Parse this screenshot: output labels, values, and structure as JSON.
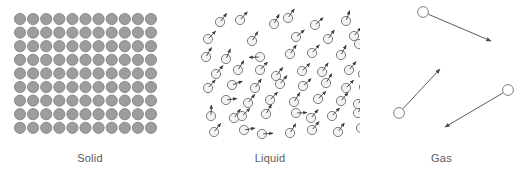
{
  "figure": {
    "width": 523,
    "height": 180,
    "background_color": "#ffffff"
  },
  "panels": [
    {
      "id": "solid",
      "label": "Solid",
      "description": "Regular close-packed lattice of filled gray particles, no motion arrows",
      "particle_style": "filled-circle",
      "particle_fill_color": "#9d9d9d",
      "particle_stroke_color": "#7e7e7e",
      "particle_radius": 5.6,
      "rows": 9,
      "cols": 11,
      "col_spacing": 13.1,
      "row_spacing": 13.6,
      "origin_x": 20,
      "origin_y": 19,
      "has_arrows": false
    },
    {
      "id": "liquid",
      "label": "Liquid",
      "description": "Densely packed but disordered open circles, each with a short motion arrow",
      "particle_style": "open-circle-with-short-arrow",
      "particle_fill_color": "#f4f4f4",
      "particle_stroke_color": "#6e6e6e",
      "particle_radius": 4.6,
      "arrow_color": "#3a3a3a",
      "arrow_length": 11,
      "has_arrows": true,
      "count": 56
    },
    {
      "id": "gas",
      "label": "Gas",
      "description": "Three widely separated open circles, each with a long motion arrow",
      "particle_style": "open-circle-with-long-arrow",
      "particle_fill_color": "#ffffff",
      "particle_stroke_color": "#707070",
      "particle_radius": 5.4,
      "arrow_color": "#4a4a4a",
      "has_arrows": true,
      "count": 3
    }
  ],
  "liquid_particles": [
    {
      "x": 22,
      "y": 14,
      "angle": -52
    },
    {
      "x": 42,
      "y": 12,
      "angle": -48
    },
    {
      "x": 76,
      "y": 16,
      "angle": -62
    },
    {
      "x": 90,
      "y": 10,
      "angle": -55
    },
    {
      "x": 117,
      "y": 17,
      "angle": -42
    },
    {
      "x": 148,
      "y": 13,
      "angle": -70
    },
    {
      "x": 10,
      "y": 31,
      "angle": -46
    },
    {
      "x": 54,
      "y": 33,
      "angle": -58
    },
    {
      "x": 98,
      "y": 29,
      "angle": -40
    },
    {
      "x": 130,
      "y": 31,
      "angle": -55
    },
    {
      "x": 156,
      "y": 28,
      "angle": -50
    },
    {
      "x": 161,
      "y": 36,
      "angle": -44
    },
    {
      "x": 8,
      "y": 49,
      "angle": -60
    },
    {
      "x": 28,
      "y": 51,
      "angle": -66
    },
    {
      "x": 62,
      "y": 49,
      "angle": 178
    },
    {
      "x": 92,
      "y": 46,
      "angle": -55
    },
    {
      "x": 114,
      "y": 45,
      "angle": -48
    },
    {
      "x": 143,
      "y": 47,
      "angle": -62
    },
    {
      "x": 18,
      "y": 66,
      "angle": -50
    },
    {
      "x": 40,
      "y": 62,
      "angle": -58
    },
    {
      "x": 62,
      "y": 62,
      "angle": -47
    },
    {
      "x": 78,
      "y": 68,
      "angle": -52
    },
    {
      "x": 104,
      "y": 63,
      "angle": -44
    },
    {
      "x": 124,
      "y": 64,
      "angle": -56
    },
    {
      "x": 151,
      "y": 62,
      "angle": -50
    },
    {
      "x": 165,
      "y": 66,
      "angle": -61
    },
    {
      "x": 10,
      "y": 80,
      "angle": -48
    },
    {
      "x": 34,
      "y": 77,
      "angle": -20
    },
    {
      "x": 57,
      "y": 80,
      "angle": -55
    },
    {
      "x": 82,
      "y": 76,
      "angle": -50
    },
    {
      "x": 105,
      "y": 78,
      "angle": -42
    },
    {
      "x": 128,
      "y": 75,
      "angle": -58
    },
    {
      "x": 148,
      "y": 80,
      "angle": -46
    },
    {
      "x": 166,
      "y": 79,
      "angle": -53
    },
    {
      "x": 28,
      "y": 92,
      "angle": -8
    },
    {
      "x": 50,
      "y": 95,
      "angle": -52
    },
    {
      "x": 72,
      "y": 92,
      "angle": -46
    },
    {
      "x": 96,
      "y": 94,
      "angle": -58
    },
    {
      "x": 120,
      "y": 91,
      "angle": -44
    },
    {
      "x": 143,
      "y": 93,
      "angle": -50
    },
    {
      "x": 160,
      "y": 96,
      "angle": -56
    },
    {
      "x": 13,
      "y": 108,
      "angle": -88
    },
    {
      "x": 36,
      "y": 110,
      "angle": -54
    },
    {
      "x": 68,
      "y": 106,
      "angle": -60
    },
    {
      "x": 98,
      "y": 105,
      "angle": -2
    },
    {
      "x": 113,
      "y": 110,
      "angle": -50
    },
    {
      "x": 134,
      "y": 108,
      "angle": -47
    },
    {
      "x": 160,
      "y": 105,
      "angle": -64
    },
    {
      "x": 16,
      "y": 124,
      "angle": -52
    },
    {
      "x": 46,
      "y": 122,
      "angle": -10
    },
    {
      "x": 64,
      "y": 126,
      "angle": -4
    },
    {
      "x": 92,
      "y": 125,
      "angle": -58
    },
    {
      "x": 114,
      "y": 122,
      "angle": -50
    },
    {
      "x": 140,
      "y": 124,
      "angle": -55
    },
    {
      "x": 163,
      "y": 120,
      "angle": -62
    },
    {
      "x": 44,
      "y": 108,
      "angle": -44
    }
  ],
  "gas_particles": [
    {
      "cx": 63,
      "cy": 12,
      "tip_x": 131,
      "tip_y": 41
    },
    {
      "cx": 39,
      "cy": 113,
      "tip_x": 80,
      "tip_y": 69
    },
    {
      "cx": 148,
      "cy": 90,
      "tip_x": 85,
      "tip_y": 127
    }
  ]
}
